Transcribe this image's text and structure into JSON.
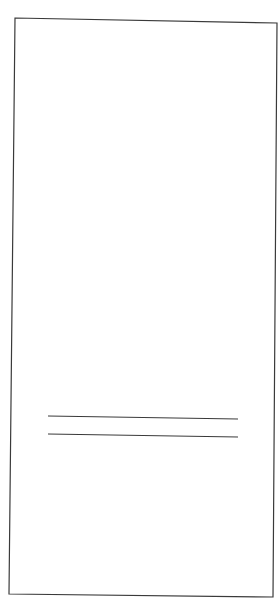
{
  "document": {
    "background": "#ffffff",
    "stroke_color": "#3a3a3a",
    "frame": {
      "points": "15,18 277,23 273,597 9,594"
    },
    "rule_lines": [
      {
        "x1": 48,
        "y1": 416,
        "x2": 238,
        "y2": 419
      },
      {
        "x1": 48,
        "y1": 434,
        "x2": 238,
        "y2": 437
      }
    ]
  }
}
